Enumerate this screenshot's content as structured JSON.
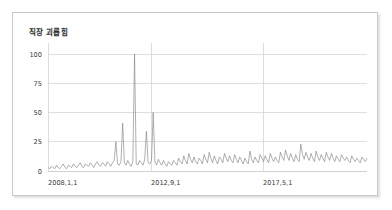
{
  "chart_data": {
    "type": "line",
    "title": "직장 괴롭힘",
    "xlabel": "",
    "ylabel": "",
    "ylim": [
      0,
      105
    ],
    "yticks": [
      0,
      25,
      50,
      75,
      100
    ],
    "ytick_labels": [
      "0",
      "25",
      "50",
      "75",
      "100"
    ],
    "xtick_labels": [
      "2008,1,1",
      "2012,9,1",
      "2017,5,1"
    ],
    "xtick_positions": [
      0,
      56,
      121
    ],
    "grid": true,
    "legend": null,
    "series": [
      {
        "name": "직장 괴롭힘",
        "values": [
          3,
          2,
          4,
          3,
          2,
          5,
          3,
          2,
          4,
          6,
          3,
          2,
          5,
          4,
          3,
          6,
          4,
          3,
          5,
          7,
          4,
          3,
          6,
          5,
          4,
          7,
          5,
          3,
          6,
          8,
          5,
          4,
          7,
          6,
          4,
          8,
          6,
          4,
          7,
          9,
          25,
          6,
          5,
          8,
          41,
          7,
          5,
          9,
          6,
          4,
          8,
          100,
          6,
          5,
          9,
          7,
          5,
          10,
          34,
          7,
          6,
          9,
          50,
          8,
          5,
          10,
          7,
          5,
          9,
          6,
          4,
          8,
          6,
          5,
          9,
          7,
          5,
          11,
          8,
          6,
          13,
          9,
          6,
          15,
          10,
          7,
          12,
          8,
          6,
          11,
          9,
          6,
          14,
          10,
          7,
          16,
          11,
          7,
          13,
          9,
          6,
          12,
          10,
          7,
          15,
          11,
          8,
          13,
          9,
          7,
          14,
          10,
          7,
          12,
          9,
          6,
          11,
          8,
          6,
          17,
          10,
          7,
          12,
          9,
          7,
          14,
          11,
          8,
          13,
          10,
          7,
          15,
          11,
          8,
          12,
          9,
          7,
          16,
          12,
          9,
          18,
          13,
          9,
          15,
          11,
          8,
          14,
          10,
          8,
          23,
          14,
          10,
          16,
          12,
          9,
          15,
          11,
          8,
          17,
          12,
          9,
          14,
          11,
          8,
          16,
          12,
          9,
          15,
          11,
          8,
          13,
          10,
          8,
          14,
          11,
          9,
          12,
          9,
          7,
          13,
          10,
          8,
          11,
          9,
          7,
          12,
          10,
          8,
          11
        ]
      }
    ]
  },
  "chart": {
    "title": "직장 괴롭힘",
    "ytick_100": "100",
    "ytick_75": "75",
    "ytick_50": "50",
    "ytick_25": "25",
    "ytick_0": "0",
    "xtick_1": "2008,1,1",
    "xtick_2": "2012,9,1",
    "xtick_3": "2017,5,1"
  },
  "colors": {
    "line": "#858585",
    "gridline": "#d2d2d2",
    "vertical_gridline": "#cfcfcf",
    "frame_border": "#c9c9c9",
    "text": "#3a3a3a",
    "background": "#ffffff"
  }
}
